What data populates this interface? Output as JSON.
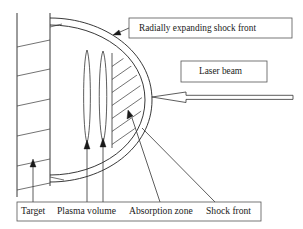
{
  "figure": {
    "background_color": "#ffffff",
    "line_color": "#222222",
    "text_color": "#1a1a1a"
  },
  "callouts": {
    "shock_front_box": {
      "label": "Radially expanding shock front",
      "box_x": 129,
      "box_y": 18,
      "box_w": 163,
      "box_h": 20
    },
    "laser_beam_box": {
      "label": "Laser beam",
      "box_x": 181,
      "box_y": 61,
      "box_w": 86,
      "box_h": 21
    }
  },
  "caption": {
    "box_x": 17,
    "box_y": 202,
    "box_w": 244,
    "box_h": 19,
    "items": [
      {
        "label": "Target",
        "x": 21
      },
      {
        "label": "Plasma volume",
        "x": 57
      },
      {
        "label": "Absorption zone",
        "x": 129
      },
      {
        "label": "Shock front",
        "x": 206
      }
    ]
  },
  "regions": {
    "target": {
      "name": "target-slab",
      "x_left": 17,
      "x_right": 50,
      "y_top": 13,
      "y_bottom": 197,
      "hatch_count": 6
    },
    "plasma_volume": {
      "name": "plasma-volume",
      "ellipse_a": {
        "cx": 87,
        "cy": 96,
        "rx": 4.5,
        "ry": 47
      },
      "ellipse_b": {
        "cx": 103,
        "cy": 96,
        "rx": 5,
        "ry": 46
      }
    },
    "absorption_zone": {
      "name": "absorption-zone-hatched",
      "x_edge": 112,
      "y_top": 53,
      "y_bottom": 148
    },
    "shock_front": {
      "name": "shock-front-shell",
      "outer_x": 152,
      "inner_x": 144,
      "y_top": 18,
      "y_bottom": 182
    }
  },
  "laser_arrow": {
    "name": "laser-beam-arrow",
    "direction": "left",
    "tip_x": 152,
    "tail_x": 293,
    "y": 97
  },
  "leader_arrows": [
    {
      "name": "target-leader",
      "tip_x": 33,
      "tip_y": 161,
      "tail_x": 33,
      "tail_y": 202
    },
    {
      "name": "plasma-leader-left",
      "tip_x": 87,
      "tip_y": 143,
      "tail_x": 87,
      "tail_y": 202
    },
    {
      "name": "plasma-leader-right",
      "tip_x": 103,
      "tip_y": 141,
      "tail_x": 103,
      "tail_y": 202
    },
    {
      "name": "absorption-leader",
      "tip_x": 129,
      "tip_y": 115,
      "tail_x": 160,
      "tail_y": 202
    },
    {
      "name": "shock-front-leader",
      "tip_x": 118,
      "tip_y": 30,
      "tail_x": 129,
      "tail_y": 27
    },
    {
      "name": "shock-front-caption-leader",
      "tip_x": 140,
      "tip_y": 130,
      "tail_x": 215,
      "tail_y": 202
    }
  ]
}
